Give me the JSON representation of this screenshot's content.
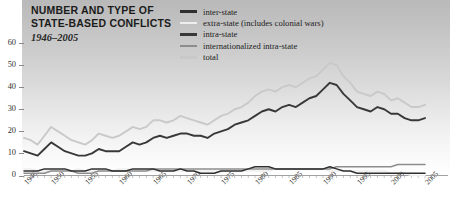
{
  "title": {
    "line1": "NUMBER AND TYPE OF",
    "line2": "STATE-BASED CONFLICTS",
    "subtitle": "1946–2005"
  },
  "colors": {
    "inter_state": "#2f2f2f",
    "extra_state": "#eeeeee",
    "intra_state": "#383838",
    "internationalized": "#8d8d8d",
    "total": "#c9c9c9",
    "axis": "#8a8a8a",
    "text": "#1b1b1b",
    "panel_top": "#b9b9b9",
    "panel_bottom": "#ffffff"
  },
  "legend": {
    "position": "top-right",
    "items": [
      {
        "label": "inter-state",
        "color": "#2f2f2f"
      },
      {
        "label": "extra-state (includes colonial wars)",
        "color": "#eeeeee"
      },
      {
        "label": "intra-state",
        "color": "#383838"
      },
      {
        "label": "internationalized intra-state",
        "color": "#8d8d8d"
      },
      {
        "label": "total",
        "color": "#c9c9c9"
      }
    ]
  },
  "chart_data": {
    "type": "line",
    "title": "NUMBER AND TYPE OF STATE-BASED CONFLICTS",
    "subtitle": "1946–2005",
    "xlabel": "",
    "ylabel": "",
    "xlim": [
      1946,
      2005
    ],
    "ylim": [
      0,
      65
    ],
    "yticks": [
      0,
      10,
      20,
      30,
      40,
      50,
      60
    ],
    "xticks": [
      1946,
      1950,
      1955,
      1960,
      1965,
      1970,
      1975,
      1980,
      1985,
      1990,
      1995,
      2000,
      2005
    ],
    "xtick_labels": [
      "1946",
      "1950",
      "1955",
      "1960",
      "1965",
      "1970",
      "1975",
      "1980",
      "1985",
      "1990",
      "1995",
      "2000",
      "2005"
    ],
    "ytick_labels": [
      "0",
      "10",
      "20",
      "30",
      "40",
      "50",
      "60"
    ],
    "grid": false,
    "legend_position": "top-right",
    "x": [
      1946,
      1947,
      1948,
      1949,
      1950,
      1951,
      1952,
      1953,
      1954,
      1955,
      1956,
      1957,
      1958,
      1959,
      1960,
      1961,
      1962,
      1963,
      1964,
      1965,
      1966,
      1967,
      1968,
      1969,
      1970,
      1971,
      1972,
      1973,
      1974,
      1975,
      1976,
      1977,
      1978,
      1979,
      1980,
      1981,
      1982,
      1983,
      1984,
      1985,
      1986,
      1987,
      1988,
      1989,
      1990,
      1991,
      1992,
      1993,
      1994,
      1995,
      1996,
      1997,
      1998,
      1999,
      2000,
      2001,
      2002,
      2003,
      2004,
      2005
    ],
    "series": [
      {
        "name": "total",
        "color": "#c9c9c9",
        "values": [
          17,
          16,
          14,
          18,
          22,
          20,
          18,
          16,
          15,
          14,
          16,
          19,
          18,
          17,
          18,
          20,
          22,
          21,
          22,
          25,
          25,
          24,
          25,
          27,
          26,
          25,
          24,
          23,
          25,
          27,
          28,
          30,
          31,
          33,
          36,
          38,
          39,
          38,
          40,
          41,
          40,
          42,
          44,
          45,
          48,
          51,
          50,
          45,
          42,
          38,
          37,
          36,
          38,
          37,
          34,
          35,
          33,
          31,
          31,
          32
        ]
      },
      {
        "name": "intra-state",
        "color": "#383838",
        "values": [
          11,
          10,
          9,
          12,
          15,
          13,
          11,
          10,
          9,
          9,
          10,
          12,
          11,
          11,
          11,
          13,
          15,
          14,
          15,
          17,
          18,
          17,
          18,
          19,
          19,
          18,
          18,
          17,
          19,
          20,
          21,
          23,
          24,
          25,
          27,
          29,
          30,
          29,
          31,
          32,
          31,
          33,
          35,
          36,
          39,
          42,
          41,
          37,
          34,
          31,
          30,
          29,
          31,
          30,
          28,
          28,
          26,
          25,
          25,
          26
        ]
      },
      {
        "name": "internationalized intra-state",
        "color": "#8d8d8d",
        "values": [
          1,
          1,
          1,
          1,
          2,
          2,
          2,
          2,
          1,
          1,
          1,
          2,
          2,
          2,
          2,
          2,
          2,
          2,
          2,
          3,
          3,
          3,
          3,
          3,
          3,
          3,
          3,
          3,
          3,
          3,
          3,
          3,
          3,
          3,
          3,
          3,
          3,
          3,
          3,
          3,
          3,
          3,
          3,
          3,
          3,
          3,
          4,
          4,
          4,
          4,
          4,
          4,
          4,
          4,
          4,
          5,
          5,
          5,
          5,
          5
        ]
      },
      {
        "name": "inter-state",
        "color": "#2f2f2f",
        "values": [
          2,
          2,
          2,
          3,
          3,
          3,
          3,
          2,
          2,
          2,
          3,
          3,
          3,
          2,
          2,
          2,
          3,
          3,
          3,
          3,
          2,
          2,
          2,
          3,
          2,
          2,
          1,
          1,
          1,
          2,
          2,
          2,
          2,
          3,
          4,
          4,
          4,
          3,
          3,
          3,
          3,
          3,
          3,
          3,
          3,
          4,
          3,
          2,
          2,
          1,
          1,
          1,
          1,
          1,
          1,
          1,
          1,
          1,
          1,
          1
        ]
      },
      {
        "name": "extra-state (includes colonial wars)",
        "color": "#eeeeee",
        "values": [
          3,
          3,
          2,
          2,
          2,
          2,
          2,
          2,
          3,
          2,
          2,
          2,
          2,
          2,
          3,
          3,
          2,
          2,
          2,
          2,
          2,
          2,
          2,
          2,
          2,
          2,
          2,
          2,
          2,
          2,
          2,
          2,
          2,
          2,
          2,
          2,
          2,
          3,
          3,
          3,
          3,
          3,
          3,
          3,
          3,
          2,
          2,
          2,
          2,
          2,
          2,
          2,
          2,
          2,
          1,
          1,
          1,
          0,
          0,
          0
        ]
      }
    ]
  }
}
